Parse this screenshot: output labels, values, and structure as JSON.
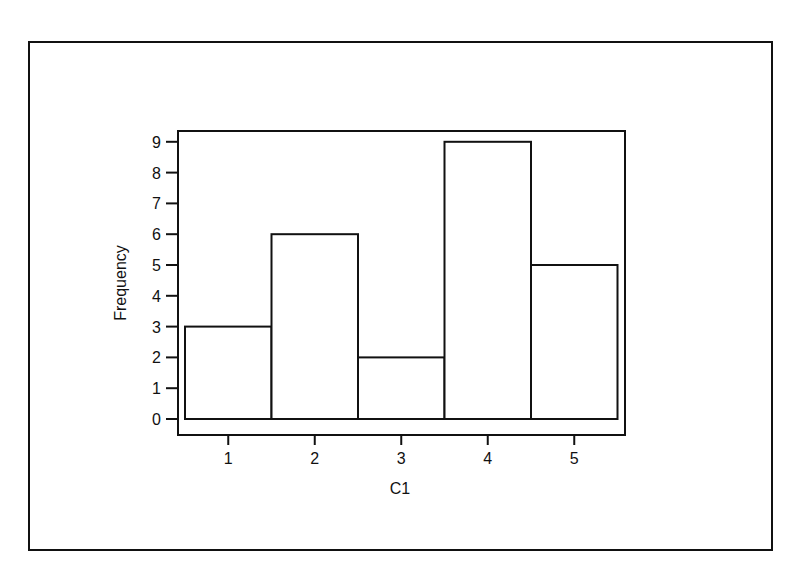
{
  "chart_data": {
    "type": "bar",
    "subtype": "histogram",
    "title": "",
    "xlabel": "C1",
    "ylabel": "Frequency",
    "categories": [
      "1",
      "2",
      "3",
      "4",
      "5"
    ],
    "values": [
      3,
      6,
      2,
      9,
      5
    ],
    "yticks": [
      0,
      1,
      2,
      3,
      4,
      5,
      6,
      7,
      8,
      9
    ],
    "xticks": [
      1,
      2,
      3,
      4,
      5
    ],
    "ylim": [
      0,
      9
    ],
    "grid": false,
    "legend": null,
    "bar_fill": "#ffffff",
    "bar_stroke": "#111111"
  },
  "labels": {
    "xlabel": "C1",
    "ylabel": "Frequency",
    "yticks": [
      "0",
      "1",
      "2",
      "3",
      "4",
      "5",
      "6",
      "7",
      "8",
      "9"
    ],
    "xticks": [
      "1",
      "2",
      "3",
      "4",
      "5"
    ]
  }
}
